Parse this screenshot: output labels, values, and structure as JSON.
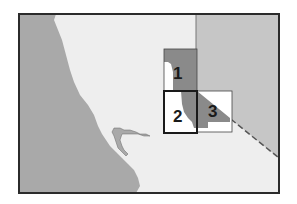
{
  "map": {
    "colors": {
      "ocean": "#a9a9a9",
      "land": "#eeeeee",
      "neighbor_state": "#c6c6c6",
      "highlight": "#8a8a8a",
      "frame": "#2b2b2b",
      "box_fill": "#ffffff"
    },
    "regions": [
      {
        "id": "1",
        "label": "1"
      },
      {
        "id": "2",
        "label": "2"
      },
      {
        "id": "3",
        "label": "3"
      }
    ]
  }
}
